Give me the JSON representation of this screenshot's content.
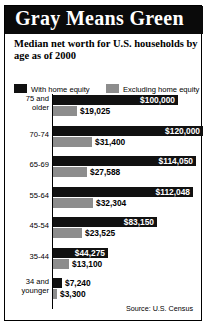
{
  "banner": {
    "title": "Gray Means Green"
  },
  "subtitle": "Median net worth for U.S. households by age as of 2000",
  "legend": [
    {
      "label": "With home equity",
      "color": "#111111"
    },
    {
      "label": "Excluding home equity",
      "color": "#8d8d8d"
    }
  ],
  "source": "Source: U.S. Census",
  "chart_data": {
    "type": "bar",
    "orientation": "horizontal",
    "title": "Gray Means Green",
    "subtitle": "Median net worth for U.S. households by age as of 2000",
    "xlabel": "",
    "ylabel": "",
    "xlim": [
      0,
      120000
    ],
    "grid": false,
    "legend_position": "top",
    "categories": [
      "75 and older",
      "70-74",
      "65-69",
      "55-64",
      "45-54",
      "35-44",
      "34 and younger"
    ],
    "category_lines": [
      [
        "75 and",
        "older"
      ],
      [
        "70-74"
      ],
      [
        "65-69"
      ],
      [
        "55-64"
      ],
      [
        "45-54"
      ],
      [
        "35-44"
      ],
      [
        "34 and",
        "younger"
      ]
    ],
    "series": [
      {
        "name": "With home equity",
        "color": "#111111",
        "values": [
          100000,
          120000,
          114050,
          112048,
          83150,
          44275,
          7240
        ],
        "labels": [
          "$100,000",
          "$120,000",
          "$114,050",
          "$112,048",
          "$83,150",
          "$44,275",
          "$7,240"
        ]
      },
      {
        "name": "Excluding home equity",
        "color": "#8d8d8d",
        "values": [
          19025,
          31400,
          27588,
          32304,
          23525,
          13100,
          3300
        ],
        "labels": [
          "$19,025",
          "$31,400",
          "$27,588",
          "$32,304",
          "$23,525",
          "$13,100",
          "$3,300"
        ]
      }
    ],
    "source": "Source: U.S. Census"
  }
}
